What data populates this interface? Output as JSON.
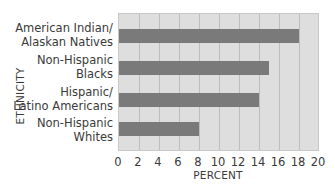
{
  "chart_data": {
    "type": "bar",
    "orientation": "horizontal",
    "title": "",
    "xlabel": "PERCENT",
    "ylabel": "ETHNICITY",
    "categories": [
      "American Indian/ Alaskan Natives",
      "Non-Hispanic Blacks",
      "Hispanic/ Latino Americans",
      "Non-Hispanic Whites"
    ],
    "category_lines": [
      [
        "American Indian/",
        "Alaskan Natives"
      ],
      [
        "Non-Hispanic",
        "Blacks"
      ],
      [
        "Hispanic/",
        "Latino Americans"
      ],
      [
        "Non-Hispanic",
        "Whites"
      ]
    ],
    "values": [
      18,
      15,
      14,
      8
    ],
    "xlim": [
      0,
      20
    ],
    "xticks": [
      "0",
      "2",
      "4",
      "6",
      "8",
      "10",
      "12",
      "14",
      "16",
      "18",
      "20"
    ],
    "grid": true,
    "legend": null,
    "colors": {
      "bar": "#7a7a7a",
      "plot_bg": "#dedede",
      "grid": "#bdbdbd"
    }
  }
}
